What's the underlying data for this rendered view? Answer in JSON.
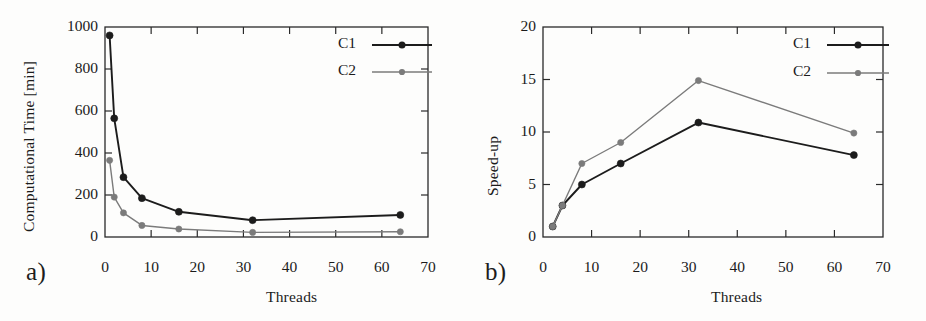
{
  "figure": {
    "panel_a_letter": "a)",
    "panel_b_letter": "b)"
  },
  "colors": {
    "c1": "#1c1c1c",
    "c2": "#7b7b7b",
    "axis": "#2a2a2a",
    "background": "#fdfdfc"
  },
  "chart_data": [
    {
      "id": "panel-a",
      "type": "line",
      "title": "",
      "xlabel": "Threads",
      "ylabel": "Computational Time [min]",
      "xlim": [
        0,
        70
      ],
      "ylim": [
        0,
        1000
      ],
      "xticks": [
        0,
        10,
        20,
        30,
        40,
        50,
        60,
        70
      ],
      "yticks": [
        0,
        200,
        400,
        600,
        800,
        1000
      ],
      "xtick_labels": [
        "0",
        "10",
        "20",
        "30",
        "40",
        "50",
        "60",
        "70"
      ],
      "ytick_labels": [
        "0",
        "200",
        "400",
        "600",
        "800",
        "1000"
      ],
      "grid": false,
      "legend_position": "top-right",
      "x": [
        1,
        2,
        4,
        8,
        16,
        32,
        64
      ],
      "series": [
        {
          "name": "C1",
          "color": "#1c1c1c",
          "values": [
            960,
            565,
            285,
            185,
            120,
            80,
            105
          ]
        },
        {
          "name": "C2",
          "color": "#7b7b7b",
          "values": [
            365,
            190,
            115,
            55,
            38,
            22,
            25
          ]
        }
      ]
    },
    {
      "id": "panel-b",
      "type": "line",
      "title": "",
      "xlabel": "Threads",
      "ylabel": "Speed-up",
      "xlim": [
        0,
        70
      ],
      "ylim": [
        0,
        20
      ],
      "xticks": [
        0,
        10,
        20,
        30,
        40,
        50,
        60,
        70
      ],
      "yticks": [
        0,
        5,
        10,
        15,
        20
      ],
      "xtick_labels": [
        "0",
        "10",
        "20",
        "30",
        "40",
        "50",
        "60",
        "70"
      ],
      "ytick_labels": [
        "0",
        "5",
        "10",
        "15",
        "20"
      ],
      "grid": false,
      "legend_position": "top-right",
      "x": [
        2,
        4,
        8,
        16,
        32,
        64
      ],
      "series": [
        {
          "name": "C1",
          "color": "#1c1c1c",
          "values": [
            1.0,
            3.0,
            5.0,
            7.0,
            10.9,
            7.8
          ]
        },
        {
          "name": "C2",
          "color": "#7b7b7b",
          "values": [
            1.0,
            3.0,
            7.0,
            9.0,
            14.9,
            9.9
          ]
        }
      ]
    }
  ]
}
